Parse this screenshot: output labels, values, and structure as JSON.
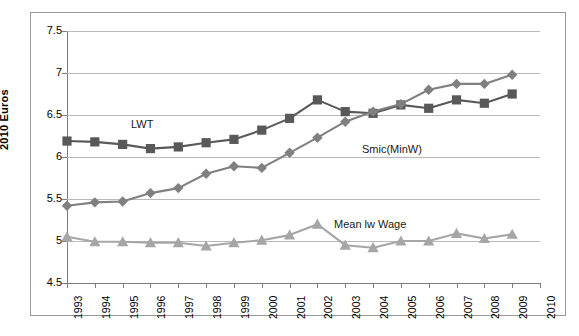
{
  "chart_data": {
    "type": "line",
    "title": "",
    "xlabel": "",
    "ylabel": "2010 Euros",
    "ylim": [
      4.5,
      7.5
    ],
    "ytick_step": 0.5,
    "yticks": [
      "7.5",
      "7",
      "6.5",
      "6",
      "5.5",
      "5",
      "4.5"
    ],
    "ytick_values": [
      7.5,
      7,
      6.5,
      6,
      5.5,
      5,
      4.5
    ],
    "categories": [
      "1993",
      "1994",
      "1995",
      "1996",
      "1997",
      "1998",
      "1999",
      "2000",
      "2001",
      "2002",
      "2003",
      "2004",
      "2005",
      "2006",
      "2007",
      "2008",
      "2009",
      "2010"
    ],
    "grid": true,
    "legend": "inline-annotations",
    "colors": {
      "lwt": "#595959",
      "smic": "#808080",
      "mean": "#a6a6a6",
      "gridline": "#b9b9b9",
      "axis": "#7d7d7d",
      "frame": "#9a9a9a",
      "text": "#000000",
      "background": "#ffffff"
    },
    "series": [
      {
        "name": "LWT",
        "key": "lwt",
        "marker": "square",
        "color": "#595959",
        "x": [
          "1993",
          "1994",
          "1995",
          "1996",
          "1997",
          "1998",
          "1999",
          "2000",
          "2001",
          "2002",
          "2003",
          "2004",
          "2005",
          "2006",
          "2007",
          "2008",
          "2009"
        ],
        "values": [
          6.19,
          6.18,
          6.15,
          6.1,
          6.12,
          6.17,
          6.21,
          6.32,
          6.46,
          6.68,
          6.54,
          6.52,
          6.62,
          6.58,
          6.68,
          6.64,
          6.75
        ]
      },
      {
        "name": "Smic(MinW)",
        "key": "smic",
        "marker": "diamond",
        "color": "#808080",
        "x": [
          "1993",
          "1994",
          "1995",
          "1996",
          "1997",
          "1998",
          "1999",
          "2000",
          "2001",
          "2002",
          "2003",
          "2004",
          "2005",
          "2006",
          "2007",
          "2008",
          "2009"
        ],
        "values": [
          5.42,
          5.46,
          5.47,
          5.57,
          5.63,
          5.8,
          5.89,
          5.87,
          6.05,
          6.23,
          6.42,
          6.54,
          6.63,
          6.8,
          6.87,
          6.87,
          6.98
        ]
      },
      {
        "name": "Mean lw Wage",
        "key": "mean",
        "marker": "triangle",
        "color": "#a6a6a6",
        "x": [
          "1993",
          "1994",
          "1995",
          "1996",
          "1997",
          "1998",
          "1999",
          "2000",
          "2001",
          "2002",
          "2003",
          "2004",
          "2005",
          "2006",
          "2007",
          "2008",
          "2009"
        ],
        "values": [
          5.05,
          4.99,
          4.99,
          4.98,
          4.98,
          4.94,
          4.98,
          5.01,
          5.07,
          5.2,
          4.95,
          4.92,
          5.0,
          5.0,
          5.09,
          5.03,
          5.08
        ]
      }
    ],
    "annotations": [
      {
        "text": "LWT",
        "series": "lwt"
      },
      {
        "text": "Smic(MinW)",
        "series": "smic"
      },
      {
        "text": "Mean lw Wage",
        "series": "mean"
      }
    ]
  },
  "axis": {
    "y_title": "2010 Euros"
  },
  "labels": {
    "lwt": "LWT",
    "smic": "Smic(MinW)",
    "mean": "Mean lw Wage"
  }
}
